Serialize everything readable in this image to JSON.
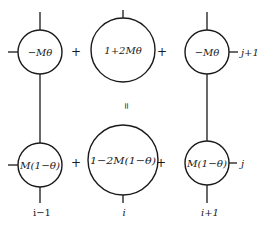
{
  "diagram": {
    "type": "finite-difference stencil (implicit-explicit weighting)",
    "operators": {
      "plus": "+",
      "equals": "="
    },
    "top_row": {
      "time_label": "j+1",
      "nodes": [
        {
          "id": "top-left",
          "text": "−Mθ",
          "position": "i-1, j+1"
        },
        {
          "id": "top-center",
          "text": "1+2Mθ",
          "position": "i, j+1"
        },
        {
          "id": "top-right",
          "text": "−Mθ",
          "position": "i+1, j+1"
        }
      ]
    },
    "bottom_row": {
      "time_label": "j",
      "nodes": [
        {
          "id": "bottom-left",
          "text": "M(1−θ)",
          "position": "i-1, j"
        },
        {
          "id": "bottom-center",
          "text": "1−2M(1−θ)",
          "position": "i, j"
        },
        {
          "id": "bottom-right",
          "text": "M(1−θ)",
          "position": "i+1, j"
        }
      ]
    },
    "space_labels": [
      "i−1",
      "i",
      "i+1"
    ],
    "colors": {
      "ink": "#1a1a1a",
      "background": "#ffffff"
    }
  }
}
